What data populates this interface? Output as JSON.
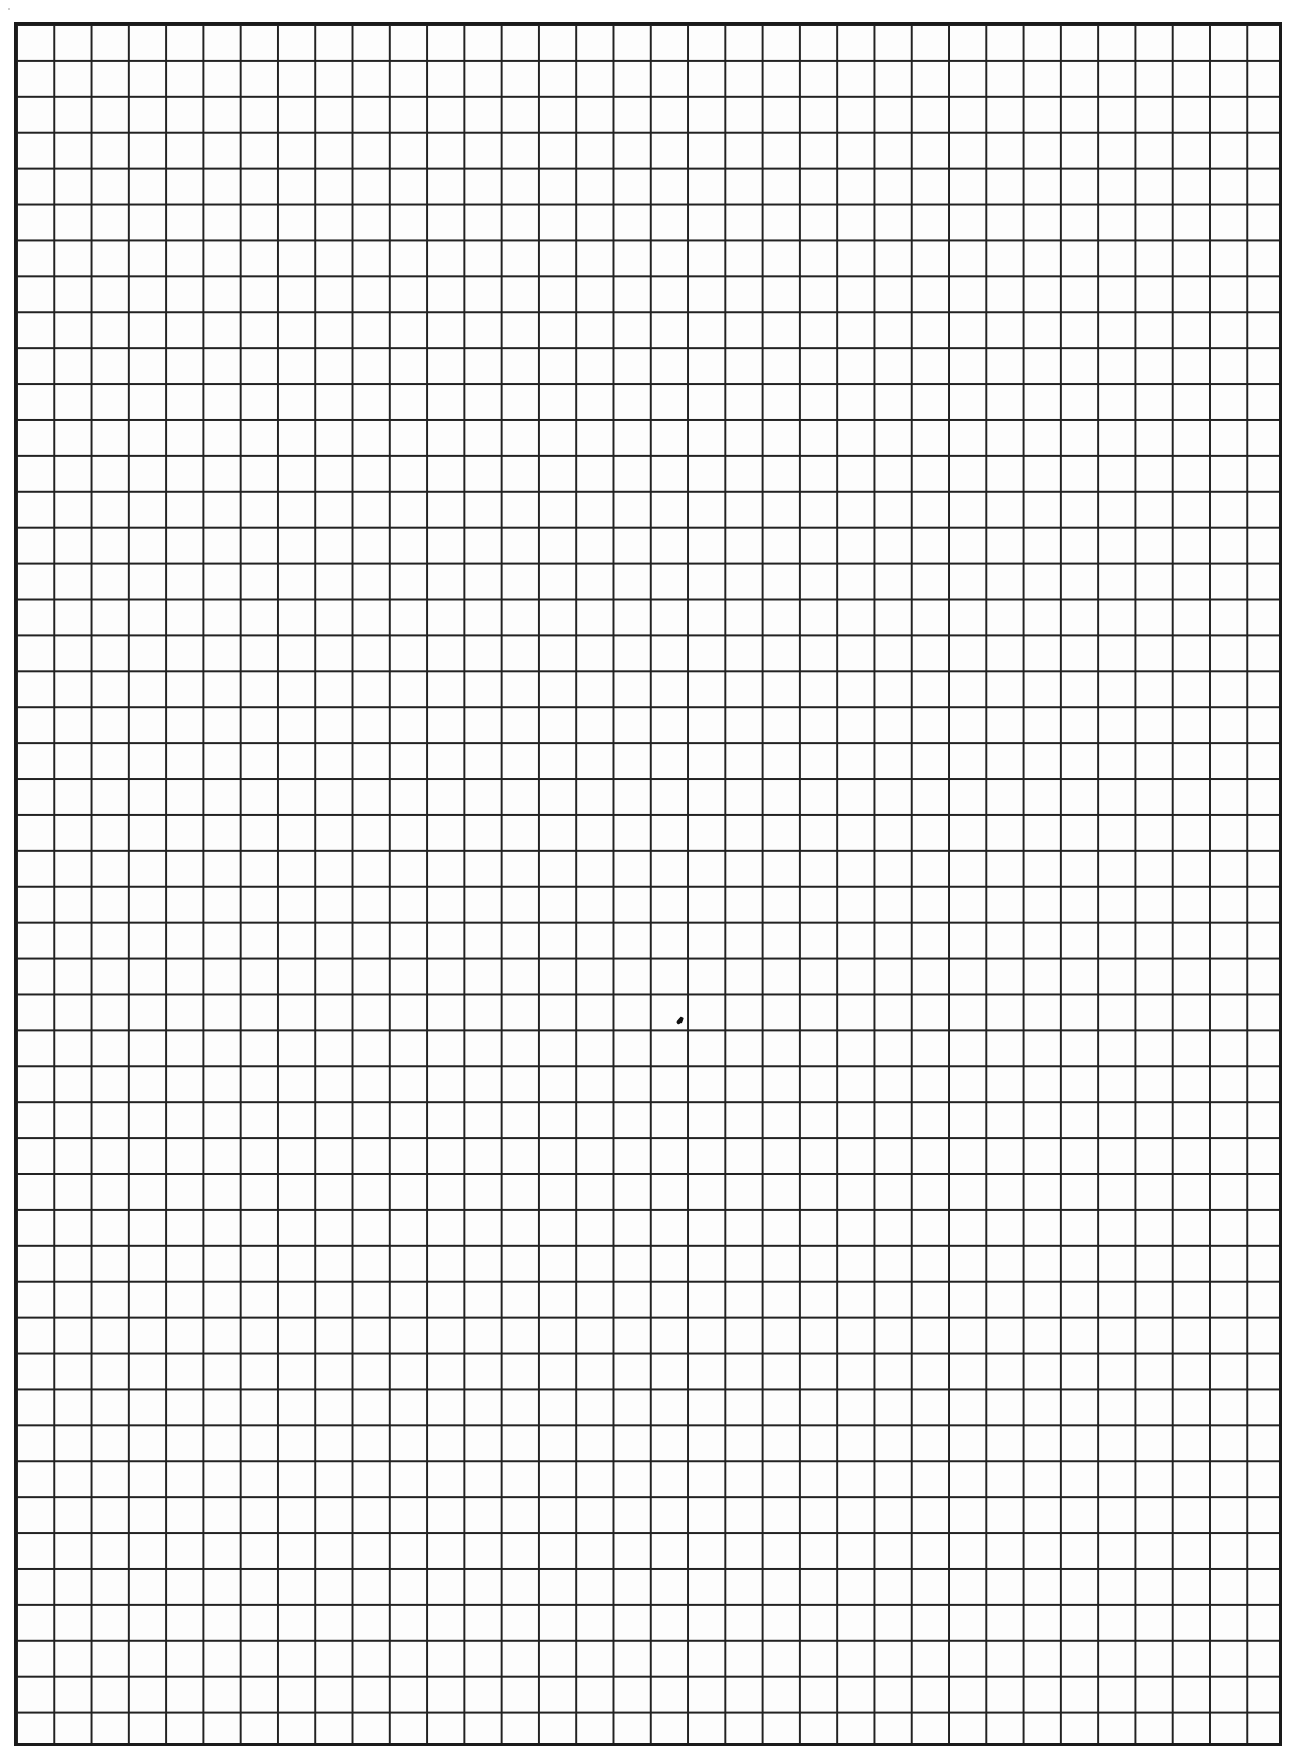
{
  "page": {
    "type": "graph-paper",
    "background_color": "#ffffff",
    "grid": {
      "columns": 34,
      "rows": 48,
      "line_color": "#222222",
      "border_color": "#1a1a1a"
    },
    "marks": [
      {
        "name": "ink-mark",
        "approx_x": 680,
        "approx_y": 1023
      }
    ]
  }
}
